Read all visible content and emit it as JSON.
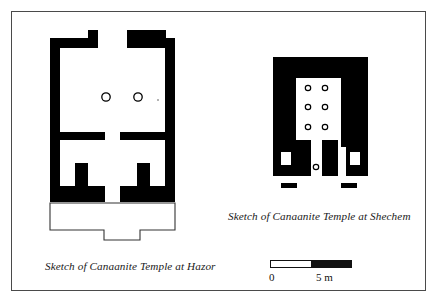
{
  "figure": {
    "border_color": "#4a4a4a",
    "background_color": "#ffffff",
    "ink_color": "#000000"
  },
  "hazor": {
    "caption": "Sketch of Canaanite Temple at Hazor",
    "plan_name": "hazor-temple-plan",
    "wall_fill": "#000000",
    "courtyard_stroke": "#333333",
    "column_count": 2,
    "columns": [
      {
        "cx": 106,
        "cy": 97,
        "r": 4.2
      },
      {
        "cx": 138,
        "cy": 97,
        "r": 4.2
      }
    ],
    "wall_outline_path": "M 50 38 L 88 38 L 88 31 L 165 31 L 165 38 L 175 38 L 175 202 L 134 202 L 134 118 L 175 118 L 175 110 L 134 110 L 134 38 L 127 38 L 127 53 L 110 53 L 110 38 L 98 38 L 98 110 L 50 110 L 50 118 L 98 118 L 98 202 L 50 202 Z",
    "wall_outer_path": "M 50 38 L 88 38 L 88 31 L 165 31 L 165 38 L 175 38 L 175 202 L 50 202 Z",
    "inner_hall_path": "M 60 48 L 110 48 L 110 38 L 127 38 L 127 53 L 165 53 L 165 110 L 60 110 Z",
    "courtyard_path": "M 50 203 L 175 203 L 175 230 L 140 230 L 140 240 L 104 240 L 104 230 L 50 230 Z"
  },
  "shechem": {
    "caption": "Sketch of Canaanite Temple at Shechem",
    "plan_name": "shechem-temple-plan",
    "wall_fill": "#000000",
    "column_count": 7,
    "columns": [
      {
        "cx": 308,
        "cy": 88,
        "r": 2.6
      },
      {
        "cx": 325,
        "cy": 88,
        "r": 2.6
      },
      {
        "cx": 308,
        "cy": 107,
        "r": 2.6
      },
      {
        "cx": 325,
        "cy": 107,
        "r": 2.6
      },
      {
        "cx": 308,
        "cy": 127,
        "r": 2.6
      },
      {
        "cx": 325,
        "cy": 127,
        "r": 2.6
      },
      {
        "cx": 316,
        "cy": 167,
        "r": 2.6
      }
    ],
    "wall_block_path": "M 273 57 L 368 57 L 368 176 L 273 176 Z",
    "cella_path": "M 296 78 L 341 78 L 341 140 L 322 140 L 322 176 L 311 176 L 311 140 L 296 140 Z",
    "niche_left_path": "M 284 146 L 296 146 L 296 176 L 273 176 L 273 166 L 284 166 Z",
    "niche_right_path": "M 341 146 L 353 146 L 353 166 L 368 166 L 368 176 L 341 176 Z",
    "pillar_left": {
      "x": 282,
      "y": 151,
      "w": 10,
      "h": 13
    },
    "pillar_right": {
      "x": 346,
      "y": 151,
      "w": 10,
      "h": 13
    },
    "tower_dash_left": {
      "x": 281,
      "y": 183,
      "w": 15,
      "h": 5
    },
    "tower_dash_right": {
      "x": 341,
      "y": 183,
      "w": 15,
      "h": 5
    }
  },
  "scalebar": {
    "name": "scale-bar",
    "label_min": "0",
    "label_max": "5 m",
    "unit": "m",
    "length_value": 5
  }
}
